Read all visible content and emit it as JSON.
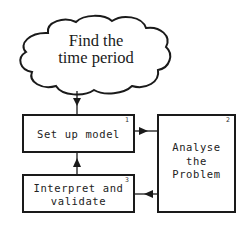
{
  "diagram": {
    "type": "flowchart",
    "start_cloud": {
      "lines": [
        "Find the",
        "time period"
      ]
    },
    "boxes": [
      {
        "id": "1",
        "number": "1",
        "lines": [
          "Set up model"
        ]
      },
      {
        "id": "2",
        "number": "2",
        "lines": [
          "Analyse",
          "the",
          "Problem"
        ]
      },
      {
        "id": "3",
        "number": "3",
        "lines": [
          "Interpret and",
          "validate"
        ]
      }
    ],
    "edges": [
      {
        "from": "cloud",
        "to": "1",
        "direction": "down"
      },
      {
        "from": "1",
        "to": "2",
        "direction": "right"
      },
      {
        "from": "2",
        "to": "3",
        "direction": "left"
      },
      {
        "from": "3",
        "to": "1",
        "direction": "up"
      }
    ],
    "colors": {
      "stroke": "#1a1a1a",
      "background": "#ffffff"
    }
  }
}
